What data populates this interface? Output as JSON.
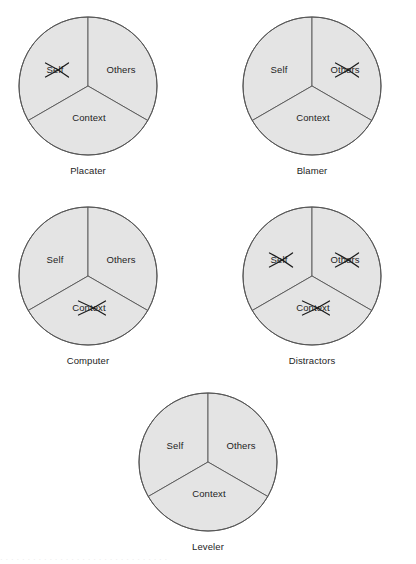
{
  "figure": {
    "background_color": "#ffffff",
    "sector_fill_color": "#e4e4e4",
    "sector_stroke_color": "#555555",
    "text_color": "#1d1d1d",
    "cross_color": "#1d1d1d",
    "footer_artifact": "· · ·  · · · · · · · · · · · · · · · · · · · · · · · · · · · ·"
  },
  "chart_data": {
    "type": "pie",
    "categories": [
      "Self",
      "Others",
      "Context"
    ],
    "values": [
      33.3,
      33.3,
      33.3
    ],
    "legend": "none",
    "note": "Five identical three-sector circles; crossed-out sectors indicate which element is omitted in each stance."
  },
  "units": [
    {
      "id": "placater",
      "caption": "Placater",
      "sectors": [
        {
          "key": "self",
          "label": "Self",
          "crossed": true
        },
        {
          "key": "others",
          "label": "Others",
          "crossed": false
        },
        {
          "key": "context",
          "label": "Context",
          "crossed": false
        }
      ]
    },
    {
      "id": "blamer",
      "caption": "Blamer",
      "sectors": [
        {
          "key": "self",
          "label": "Self",
          "crossed": false
        },
        {
          "key": "others",
          "label": "Others",
          "crossed": true
        },
        {
          "key": "context",
          "label": "Context",
          "crossed": false
        }
      ]
    },
    {
      "id": "computer",
      "caption": "Computer",
      "sectors": [
        {
          "key": "self",
          "label": "Self",
          "crossed": false
        },
        {
          "key": "others",
          "label": "Others",
          "crossed": false
        },
        {
          "key": "context",
          "label": "Context",
          "crossed": true
        }
      ]
    },
    {
      "id": "distractors",
      "caption": "Distractors",
      "sectors": [
        {
          "key": "self",
          "label": "Self",
          "crossed": true
        },
        {
          "key": "others",
          "label": "Others",
          "crossed": true
        },
        {
          "key": "context",
          "label": "Context",
          "crossed": true
        }
      ]
    },
    {
      "id": "leveler",
      "caption": "Leveler",
      "sectors": [
        {
          "key": "self",
          "label": "Self",
          "crossed": false
        },
        {
          "key": "others",
          "label": "Others",
          "crossed": false
        },
        {
          "key": "context",
          "label": "Context",
          "crossed": false
        }
      ]
    }
  ]
}
